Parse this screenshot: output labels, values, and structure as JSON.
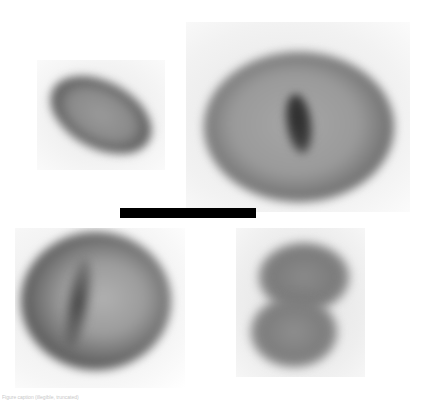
{
  "figure": {
    "panels": [
      {
        "id": "top-left",
        "label": "Elliptical grain with dark rim",
        "x": 37,
        "y": 60,
        "w": 128,
        "h": 110
      },
      {
        "id": "top-right",
        "label": "Large round grain with central dark furrow",
        "x": 186,
        "y": 22,
        "w": 224,
        "h": 190
      },
      {
        "id": "bottom-left",
        "label": "Round grain with dark ring and fold",
        "x": 15,
        "y": 228,
        "w": 170,
        "h": 160
      },
      {
        "id": "bottom-right",
        "label": "Bilobed grain",
        "x": 236,
        "y": 228,
        "w": 129,
        "h": 149
      }
    ],
    "scale_bar": {
      "x": 120,
      "y": 208,
      "w": 136,
      "h": 10,
      "color": "#000000"
    },
    "caption": "Figure caption (illegible, truncated)"
  },
  "colors": {
    "background": "#ffffff",
    "panel_bg": "#eeeeee",
    "cell_mid": "#8a8a8a",
    "cell_dark": "#3a3a3a"
  }
}
